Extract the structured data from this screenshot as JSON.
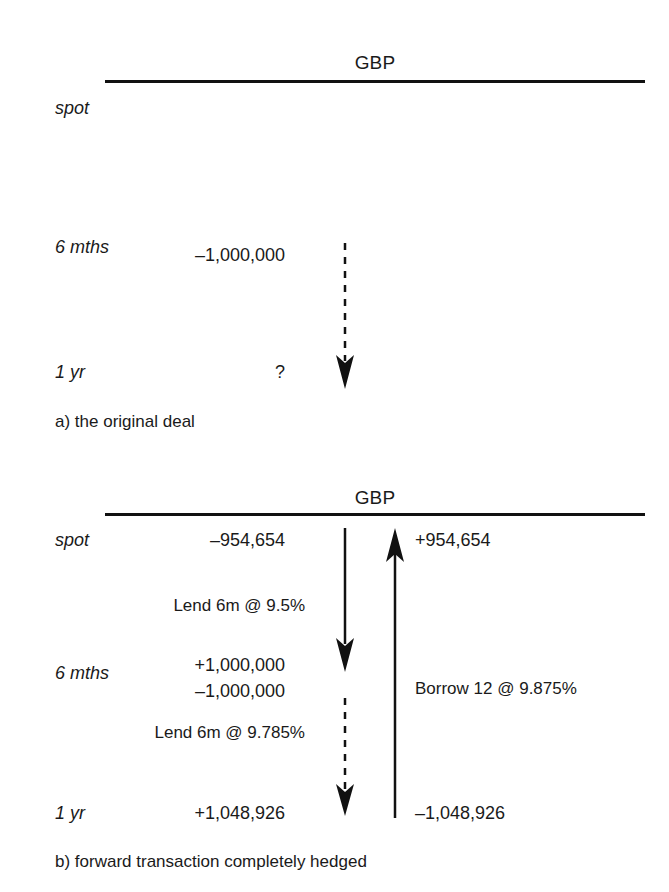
{
  "figure": {
    "currency_header": "GBP",
    "row_labels": {
      "spot": "spot",
      "six_months": "6 mths",
      "one_year": "1 yr"
    }
  },
  "panel_a": {
    "caption": "a) the original deal",
    "header": "GBP",
    "rows": {
      "spot": "spot",
      "six_months": "6 mths",
      "one_year": "1 yr"
    },
    "flows": {
      "six_months_amount": "–1,000,000",
      "one_year_amount": "?"
    },
    "arrows": [
      {
        "name": "forward-flow-arrow",
        "style": "dashed",
        "direction": "down"
      }
    ]
  },
  "panel_b": {
    "caption": "b) forward transaction completely hedged",
    "header": "GBP",
    "rows": {
      "spot": "spot",
      "six_months": "6 mths",
      "one_year": "1 yr"
    },
    "left_column": {
      "spot_amount": "–954,654",
      "lend_first": "Lend 6m @ 9.5%",
      "six_months_inflow": "+1,000,000",
      "six_months_outflow": "–1,000,000",
      "lend_second": "Lend 6m @ 9.785%",
      "one_year_amount": "+1,048,926"
    },
    "right_column": {
      "spot_amount": "+954,654",
      "borrow_note": "Borrow 12 @ 9.875%",
      "one_year_amount": "–1,048,926"
    },
    "arrows": [
      {
        "name": "lend-first-leg-arrow",
        "style": "solid",
        "direction": "down"
      },
      {
        "name": "lend-second-leg-arrow",
        "style": "dashed",
        "direction": "down"
      },
      {
        "name": "borrow-12m-arrow",
        "style": "solid",
        "direction": "up"
      }
    ]
  },
  "colors": {
    "ink": "#1a1a1a",
    "rule": "#111111"
  }
}
